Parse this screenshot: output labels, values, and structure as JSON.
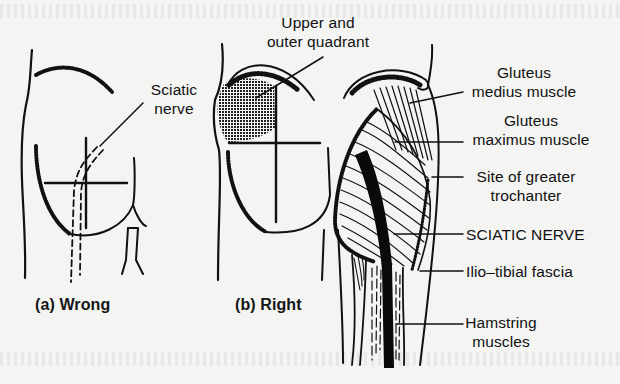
{
  "figure": {
    "panels": [
      {
        "id": "a",
        "caption": "(a) Wrong",
        "status": "wrong"
      },
      {
        "id": "b",
        "caption": "(b) Right",
        "status": "right"
      }
    ],
    "labels": {
      "sciatic_nerve_panel_a": [
        "Sciatic",
        "nerve"
      ],
      "upper_outer_quadrant": [
        "Upper and",
        "outer quadrant"
      ],
      "gluteus_medius": [
        "Gluteus",
        "medius muscle"
      ],
      "gluteus_maximus": [
        "Gluteus",
        "maximus muscle"
      ],
      "greater_trochanter": [
        "Site of greater",
        "trochanter"
      ],
      "sciatic_nerve_anatomy": "SCIATIC NERVE",
      "iliotibial_fascia": "Ilio–tibial fascia",
      "hamstring": [
        "Hamstring",
        "muscles"
      ]
    },
    "colors": {
      "background": "#f4f4f2",
      "ink": "#111111",
      "nerve_fill": "#0a0a0a",
      "shaded_quadrant": "#3a3a3a"
    }
  }
}
